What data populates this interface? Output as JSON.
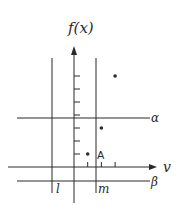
{
  "diagram": {
    "y_axis_label": "f(x)",
    "x_axis_label": "v",
    "horizontal_lines": [
      {
        "name": "alpha",
        "label": "α"
      },
      {
        "name": "beta",
        "label": "β"
      }
    ],
    "vertical_lines": [
      {
        "name": "l",
        "label": "l"
      },
      {
        "name": "m",
        "label": "m"
      }
    ],
    "point_label": "A",
    "points": [
      {
        "x": 1,
        "y": 1,
        "labeled": true
      },
      {
        "x": 2,
        "y": 3,
        "labeled": false
      },
      {
        "x": 3,
        "y": 7,
        "labeled": false
      }
    ],
    "y_ticks": 7,
    "x_ticks": 3,
    "ink_color": "#2a2a2a"
  }
}
